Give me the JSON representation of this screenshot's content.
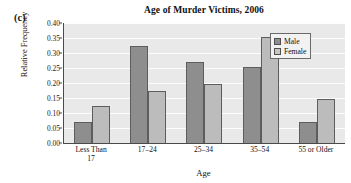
{
  "figure": {
    "part_label": "(c)"
  },
  "legend": {
    "position": "top-right",
    "entries": [
      {
        "label": "Male",
        "swatch": "male-swatch",
        "color": "#8e8e8e"
      },
      {
        "label": "Female",
        "swatch": "female-swatch",
        "color": "#c6c6c6"
      }
    ]
  },
  "axes": {
    "yticks": [
      "0.00",
      "0.05",
      "0.10",
      "0.15",
      "0.20",
      "0.25",
      "0.30",
      "0.35",
      "0.40"
    ],
    "ylabel": "Relative Frequency",
    "xlabel": "Age",
    "xticks": [
      {
        "line1": "Less Than",
        "line2": "17"
      },
      {
        "line1": "17–24",
        "line2": ""
      },
      {
        "line1": "25–34",
        "line2": ""
      },
      {
        "line1": "35–54",
        "line2": ""
      },
      {
        "line1": "55 or Older",
        "line2": ""
      }
    ]
  },
  "chart_data": {
    "type": "bar",
    "title": "Age of Murder Victims, 2006",
    "xlabel": "Age",
    "ylabel": "Relative Frequency",
    "categories": [
      "Less Than 17",
      "17–24",
      "25–34",
      "35–54",
      "55 or Older"
    ],
    "series": [
      {
        "name": "Male",
        "color": "#8e8e8e",
        "values": [
          0.07,
          0.324,
          0.271,
          0.255,
          0.071
        ]
      },
      {
        "name": "Female",
        "color": "#bcbcbc",
        "values": [
          0.124,
          0.175,
          0.197,
          0.353,
          0.147
        ]
      }
    ],
    "ylim": [
      0.0,
      0.4
    ],
    "ytick_step": 0.05,
    "grid": true,
    "grid_axis": "y",
    "legend_position": "top-right"
  }
}
